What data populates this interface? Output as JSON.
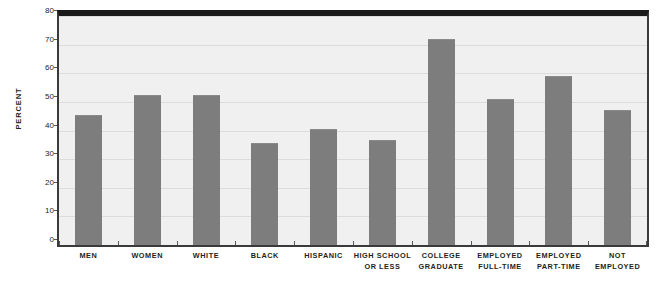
{
  "chart_data": {
    "type": "bar",
    "title": "",
    "xlabel": "",
    "ylabel": "Percent",
    "ylim": [
      0,
      80
    ],
    "yticks": [
      0,
      10,
      20,
      30,
      40,
      50,
      60,
      70,
      80
    ],
    "ytick_labels": [
      "0",
      "10",
      "20",
      "30",
      "40",
      "50",
      "60",
      "70",
      "80"
    ],
    "grid": true,
    "legend": false,
    "bar_color": "#7d7d7d",
    "plot_background": "#f0f0f0",
    "categories": [
      "Men",
      "Women",
      "White",
      "Black",
      "Hispanic",
      "High School or Less",
      "College Graduate",
      "Employed Full-time",
      "Employed Part-time",
      "Not Employed"
    ],
    "category_lines": [
      [
        "Men",
        ""
      ],
      [
        "Women",
        ""
      ],
      [
        "White",
        ""
      ],
      [
        "Black",
        ""
      ],
      [
        "Hispanic",
        ""
      ],
      [
        "High School",
        "or Less"
      ],
      [
        "College",
        "Graduate"
      ],
      [
        "Employed",
        "Full-time"
      ],
      [
        "Employed",
        "Part-time"
      ],
      [
        "Not",
        "Employed"
      ]
    ],
    "values": [
      45.5,
      52.5,
      52.5,
      35.7,
      40.7,
      36.8,
      72.0,
      51.0,
      59.0,
      47.0
    ]
  }
}
